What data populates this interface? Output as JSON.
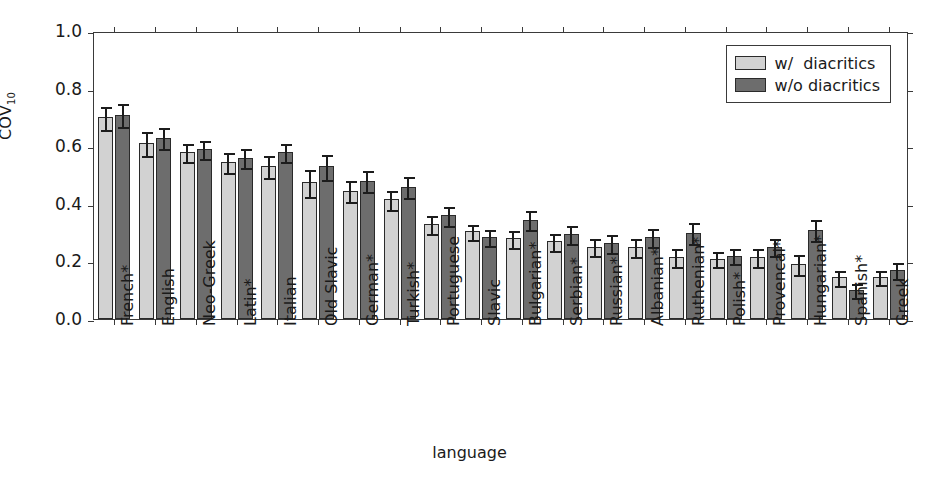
{
  "chart_data": {
    "type": "bar",
    "title": "",
    "xlabel": "language",
    "ylabel": "COV",
    "ylabel_sub": "10",
    "ylim": [
      0.0,
      1.0
    ],
    "yticks": [
      0.0,
      0.2,
      0.4,
      0.6,
      0.8,
      1.0
    ],
    "ytick_labels": [
      "0.0",
      "0.2",
      "0.4",
      "0.6",
      "0.8",
      "1.0"
    ],
    "grid": false,
    "legend_position": "upper right",
    "categories": [
      "French*",
      "English",
      "Neo-Greek",
      "Latin*",
      "Italian",
      "Old Slavic",
      "German*",
      "Turkish*",
      "Portuguese",
      "Slavic",
      "Bulgarian*",
      "Serbian*",
      "Russian*",
      "Albanian*",
      "Ruthenian*",
      "Polish*",
      "Provencal*",
      "Hungarian*",
      "Spanish*",
      "Greek"
    ],
    "series": [
      {
        "name": "w/  diacritics",
        "color": "#d2d2d2",
        "values": [
          0.7,
          0.61,
          0.58,
          0.545,
          0.53,
          0.475,
          0.445,
          0.415,
          0.33,
          0.305,
          0.28,
          0.27,
          0.25,
          0.25,
          0.215,
          0.21,
          0.215,
          0.19,
          0.145,
          0.145
        ],
        "errors": [
          0.043,
          0.045,
          0.035,
          0.037,
          0.042,
          0.05,
          0.04,
          0.038,
          0.035,
          0.03,
          0.032,
          0.033,
          0.033,
          0.035,
          0.035,
          0.028,
          0.035,
          0.038,
          0.03,
          0.028
        ]
      },
      {
        "name": "w/o diacritics",
        "color": "#6d6d6d",
        "values": [
          0.71,
          0.63,
          0.59,
          0.56,
          0.58,
          0.53,
          0.48,
          0.46,
          0.36,
          0.285,
          0.345,
          0.295,
          0.265,
          0.285,
          0.3,
          0.22,
          0.25,
          0.31,
          0.1,
          0.17
        ],
        "errors": [
          0.042,
          0.04,
          0.035,
          0.036,
          0.035,
          0.047,
          0.04,
          0.04,
          0.037,
          0.03,
          0.037,
          0.035,
          0.035,
          0.035,
          0.04,
          0.03,
          0.033,
          0.04,
          0.028,
          0.03
        ]
      }
    ]
  },
  "legend": {
    "items": [
      {
        "label": "w/  diacritics",
        "swatch": "light"
      },
      {
        "label": "w/o diacritics",
        "swatch": "dark"
      }
    ]
  },
  "axes": {
    "y_label_main": "COV",
    "y_label_sub": "10",
    "x_title": "language"
  }
}
